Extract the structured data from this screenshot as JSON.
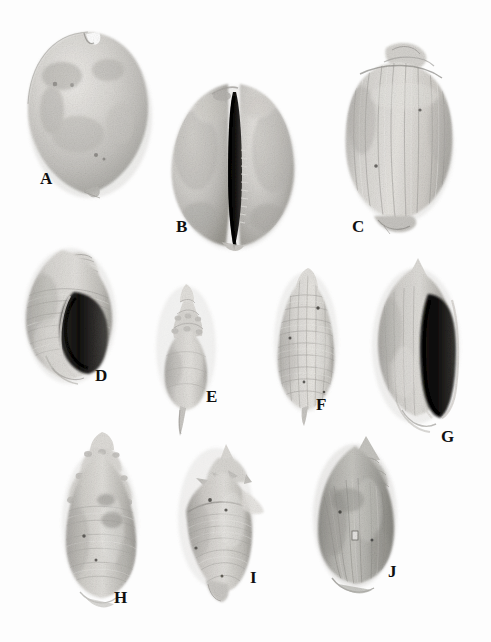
{
  "plate": {
    "kind": "scientific-plate",
    "medium": "black-and-white photographic plate",
    "subject": "fossil gastropod shells",
    "background_color": "#fdfdfd",
    "label_color": "#101010",
    "width": 491,
    "height": 642,
    "rows": 3,
    "specimen_count": 10
  },
  "specimens": [
    {
      "label": "A",
      "row": 1,
      "form": "cowrie-dorsal",
      "description": "broad smooth inflated shell, dorsal view, notch at apex",
      "cx": 88,
      "cy": 112,
      "rx": 62,
      "ry": 82,
      "tone_light": "#e3e2df",
      "tone_mid": "#c2c1bd",
      "tone_dark": "#9b9a96"
    },
    {
      "label": "B",
      "row": 1,
      "form": "cowrie-ventral",
      "description": "cowrie in ventral view with dark toothed central aperture slit",
      "cx": 232,
      "cy": 163,
      "rx": 62,
      "ry": 82,
      "tone_light": "#dedcd8",
      "tone_mid": "#bab8b4",
      "tone_dark": "#8e8d89"
    },
    {
      "label": "C",
      "row": 1,
      "form": "globose-ribbed",
      "description": "globose shell with vertical ribs and low conical spire",
      "cx": 398,
      "cy": 140,
      "rx": 52,
      "ry": 78,
      "tone_light": "#e1e0dc",
      "tone_mid": "#bebcb8",
      "tone_dark": "#94938f"
    },
    {
      "label": "D",
      "row": 2,
      "form": "buccinid-aperture",
      "description": "ribbed spire with broad dark aperture on right side",
      "cx": 68,
      "cy": 312,
      "rx": 44,
      "ry": 68,
      "tone_light": "#dcdbd7",
      "tone_mid": "#b7b6b2",
      "tone_dark": "#8b8a86"
    },
    {
      "label": "E",
      "row": 2,
      "form": "fusiform-small",
      "description": "small fusiform shell with tall pointed spire and short canal",
      "cx": 185,
      "cy": 345,
      "rx": 28,
      "ry": 62,
      "tone_light": "#dfdedb",
      "tone_mid": "#bbb9b5",
      "tone_dark": "#918f8b"
    },
    {
      "label": "F",
      "row": 2,
      "form": "cancellate-turrid",
      "description": "elongate shell with cancellate lattice sculpture",
      "cx": 306,
      "cy": 340,
      "rx": 31,
      "ry": 68,
      "tone_light": "#e2e1de",
      "tone_mid": "#c0bfbb",
      "tone_dark": "#969591"
    },
    {
      "label": "G",
      "row": 2,
      "form": "volute-aperture",
      "description": "spindle shell with tall dark elongate aperture at right",
      "cx": 416,
      "cy": 342,
      "rx": 42,
      "ry": 78,
      "tone_light": "#dbdad6",
      "tone_mid": "#b5b4b0",
      "tone_dark": "#898884"
    },
    {
      "label": "H",
      "row": 3,
      "form": "nodulose-elongate",
      "description": "elongate shell with nodular shouldered whorls",
      "cx": 100,
      "cy": 520,
      "rx": 37,
      "ry": 74,
      "tone_light": "#dedcd9",
      "tone_mid": "#b9b7b3",
      "tone_dark": "#8d8c88"
    },
    {
      "label": "I",
      "row": 3,
      "form": "shouldered-spinose",
      "description": "angular shouldered shell with spiny spire and tapering base",
      "cx": 217,
      "cy": 515,
      "rx": 36,
      "ry": 68,
      "tone_light": "#dddcd8",
      "tone_mid": "#b6b5b1",
      "tone_dark": "#8a8985"
    },
    {
      "label": "J",
      "row": 3,
      "form": "conical-dark",
      "description": "broad conical shell, darker tone, with pointed spire",
      "cx": 355,
      "cy": 512,
      "rx": 40,
      "ry": 72,
      "tone_light": "#c9c8c4",
      "tone_mid": "#a3a29e",
      "tone_dark": "#77766f"
    }
  ]
}
